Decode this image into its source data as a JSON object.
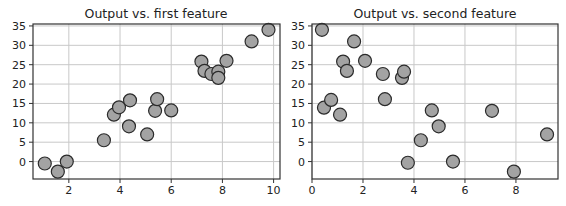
{
  "chart_data": [
    {
      "type": "scatter",
      "title": "Output vs. first feature",
      "xlabel": "",
      "ylabel": "",
      "xlim": [
        0.6,
        10.25
      ],
      "ylim": [
        -4.5,
        35.5
      ],
      "xticks": [
        2,
        4,
        6,
        8,
        10
      ],
      "yticks": [
        0,
        5,
        10,
        15,
        20,
        25,
        30,
        35
      ],
      "grid": true,
      "marker": {
        "face": "#a3a3a3",
        "edge": "#2b2b2b",
        "radius": 6.5
      },
      "points": [
        {
          "x": 1.06,
          "y": -0.5
        },
        {
          "x": 1.57,
          "y": -2.6
        },
        {
          "x": 1.92,
          "y": 0.0
        },
        {
          "x": 3.37,
          "y": 5.5
        },
        {
          "x": 3.76,
          "y": 12.1
        },
        {
          "x": 3.96,
          "y": 14.0
        },
        {
          "x": 4.35,
          "y": 9.1
        },
        {
          "x": 4.39,
          "y": 15.8
        },
        {
          "x": 5.06,
          "y": 7.0
        },
        {
          "x": 5.37,
          "y": 13.1
        },
        {
          "x": 5.45,
          "y": 16.1
        },
        {
          "x": 6.0,
          "y": 13.2
        },
        {
          "x": 7.18,
          "y": 25.8
        },
        {
          "x": 7.3,
          "y": 23.4
        },
        {
          "x": 7.57,
          "y": 22.6
        },
        {
          "x": 7.84,
          "y": 23.2
        },
        {
          "x": 7.84,
          "y": 21.6
        },
        {
          "x": 8.16,
          "y": 26.0
        },
        {
          "x": 9.14,
          "y": 31.0
        },
        {
          "x": 9.8,
          "y": 34.0
        }
      ]
    },
    {
      "type": "scatter",
      "title": "Output vs. second feature",
      "xlabel": "",
      "ylabel": "",
      "xlim": [
        0,
        9.65
      ],
      "ylim": [
        -4.5,
        35.5
      ],
      "xticks": [
        0,
        2,
        4,
        6,
        8
      ],
      "yticks": [
        0,
        5,
        10,
        15,
        20,
        25,
        30,
        35
      ],
      "grid": true,
      "marker": {
        "face": "#a3a3a3",
        "edge": "#2b2b2b",
        "radius": 6.5
      },
      "points": [
        {
          "x": 0.39,
          "y": 34.0
        },
        {
          "x": 0.47,
          "y": 13.9
        },
        {
          "x": 0.75,
          "y": 15.9
        },
        {
          "x": 1.1,
          "y": 12.1
        },
        {
          "x": 1.22,
          "y": 25.8
        },
        {
          "x": 1.37,
          "y": 23.4
        },
        {
          "x": 1.65,
          "y": 31.0
        },
        {
          "x": 2.08,
          "y": 26.0
        },
        {
          "x": 2.78,
          "y": 22.6
        },
        {
          "x": 2.86,
          "y": 16.1
        },
        {
          "x": 3.53,
          "y": 21.6
        },
        {
          "x": 3.61,
          "y": 23.2
        },
        {
          "x": 3.76,
          "y": -0.3
        },
        {
          "x": 4.27,
          "y": 5.5
        },
        {
          "x": 4.7,
          "y": 13.2
        },
        {
          "x": 4.97,
          "y": 9.1
        },
        {
          "x": 5.53,
          "y": 0.0
        },
        {
          "x": 7.06,
          "y": 13.1
        },
        {
          "x": 7.92,
          "y": -2.6
        },
        {
          "x": 9.22,
          "y": 7.0
        }
      ]
    }
  ],
  "panels": [
    {
      "title": "Output vs. first feature",
      "box": {
        "left": 33,
        "top": 24,
        "right": 280,
        "bottom": 179
      },
      "title_x": 156
    },
    {
      "title": "Output vs. second feature",
      "box": {
        "left": 312,
        "top": 24,
        "right": 558,
        "bottom": 179
      },
      "title_x": 435
    }
  ],
  "colors": {
    "grid": "#c8c8c8",
    "spine": "#333333",
    "background": "#ffffff"
  }
}
